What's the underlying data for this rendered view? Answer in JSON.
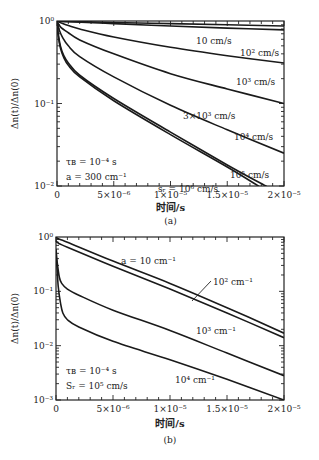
{
  "chart_data": [
    {
      "type": "line",
      "panel": "a",
      "caption": "(a)",
      "xlabel": "时间/s",
      "ylabel": "Δn(t)/Δn(0)",
      "xscale": "linear",
      "yscale": "log",
      "xlim": [
        0,
        2e-05
      ],
      "ylim": [
        0.01,
        1
      ],
      "xticks": [
        0,
        5e-06,
        1e-05,
        1.5e-05,
        2e-05
      ],
      "xtick_labels": [
        "0",
        "5×10⁻⁶",
        "1×10⁻⁵",
        "1.5×10⁻⁵",
        "2×10⁻⁵"
      ],
      "yticks": [
        1,
        0.1,
        0.01
      ],
      "ytick_labels": [
        "10⁰",
        "10⁻¹",
        "10⁻²"
      ],
      "grid": false,
      "annotations": [
        "τB = 10⁻⁴ s",
        "a = 300 cm⁻¹"
      ],
      "series": [
        {
          "name": "10 cm/s",
          "label": "10 cm/s",
          "x": [
            0,
            1e-06,
            5e-06,
            1e-05,
            1.5e-05,
            2e-05
          ],
          "y": [
            1.0,
            0.99,
            0.96,
            0.93,
            0.9,
            0.87
          ]
        },
        {
          "name": "10² cm/s",
          "label": "10² cm/s",
          "x": [
            0,
            1e-06,
            5e-06,
            1e-05,
            1.5e-05,
            2e-05
          ],
          "y": [
            1.0,
            0.98,
            0.93,
            0.87,
            0.82,
            0.78
          ]
        },
        {
          "name": "10³ cm/s",
          "label": "10³ cm/s",
          "x": [
            0,
            5e-07,
            1e-06,
            2e-06,
            5e-06,
            1e-05,
            1.5e-05,
            2e-05
          ],
          "y": [
            1.0,
            0.93,
            0.88,
            0.8,
            0.64,
            0.48,
            0.38,
            0.31
          ]
        },
        {
          "name": "3×10³ cm/s",
          "label": "3×10³ cm/s",
          "x": [
            0,
            3e-07,
            1e-06,
            2e-06,
            5e-06,
            1e-05,
            1.5e-05,
            2e-05
          ],
          "y": [
            1.0,
            0.85,
            0.72,
            0.59,
            0.4,
            0.23,
            0.15,
            0.1
          ]
        },
        {
          "name": "10⁴ cm/s",
          "label": "10⁴ cm/s",
          "x": [
            0,
            2e-07,
            5e-07,
            1e-06,
            2e-06,
            5e-06,
            1e-05,
            1.5e-05,
            2e-05
          ],
          "y": [
            1.0,
            0.78,
            0.63,
            0.5,
            0.37,
            0.21,
            0.095,
            0.048,
            0.025
          ]
        },
        {
          "name": "10⁵ cm/s",
          "label": "10⁵ cm/s",
          "x": [
            0,
            1e-07,
            3e-07,
            6e-07,
            1e-06,
            2e-06,
            5e-06,
            1e-05,
            1.5e-05,
            1.85e-05
          ],
          "y": [
            1.0,
            0.72,
            0.5,
            0.38,
            0.31,
            0.22,
            0.115,
            0.045,
            0.018,
            0.0098
          ]
        },
        {
          "name": "10⁶ cm/s",
          "label": "s_r = 10⁶ cm/s",
          "x": [
            0,
            1e-07,
            3e-07,
            6e-07,
            1e-06,
            2e-06,
            5e-06,
            1e-05,
            1.5e-05,
            1.78e-05
          ],
          "y": [
            1.0,
            0.68,
            0.47,
            0.36,
            0.29,
            0.21,
            0.108,
            0.042,
            0.017,
            0.0099
          ]
        }
      ]
    },
    {
      "type": "line",
      "panel": "b",
      "caption": "(b)",
      "xlabel": "时间/s",
      "ylabel": "Δn(t)/Δn(0)",
      "xscale": "linear",
      "yscale": "log",
      "xlim": [
        0,
        2e-05
      ],
      "ylim": [
        0.001,
        1
      ],
      "xticks": [
        0,
        5e-06,
        1e-05,
        1.5e-05,
        2e-05
      ],
      "xtick_labels": [
        "0",
        "5×10⁻⁶",
        "1×10⁻⁵",
        "1.5×10⁻⁵",
        "2×10⁻⁵"
      ],
      "yticks": [
        1,
        0.1,
        0.01,
        0.001
      ],
      "ytick_labels": [
        "10⁰",
        "10⁻¹",
        "10⁻²",
        "10⁻³"
      ],
      "grid": false,
      "annotations": [
        "τB = 10⁻⁴ s",
        "Sr = 10⁵ cm/s"
      ],
      "series": [
        {
          "name": "a = 10 cm⁻¹",
          "label": "a = 10 cm⁻¹",
          "x": [
            0,
            2e-07,
            1e-06,
            5e-06,
            1e-05,
            1.5e-05,
            2e-05
          ],
          "y": [
            1.0,
            0.93,
            0.8,
            0.36,
            0.14,
            0.05,
            0.017
          ]
        },
        {
          "name": "10² cm⁻¹",
          "label": "10² cm⁻¹",
          "x": [
            0,
            2e-07,
            1e-06,
            5e-06,
            1e-05,
            1.5e-05,
            2e-05
          ],
          "y": [
            0.85,
            0.77,
            0.65,
            0.29,
            0.11,
            0.04,
            0.014
          ]
        },
        {
          "name": "10³ cm⁻¹",
          "label": "10³ cm⁻¹",
          "x": [
            0,
            1e-07,
            3e-07,
            5e-07,
            1e-06,
            2e-06,
            5e-06,
            1e-05,
            1.5e-05,
            2e-05
          ],
          "y": [
            0.6,
            0.35,
            0.18,
            0.14,
            0.11,
            0.085,
            0.045,
            0.019,
            0.0073,
            0.0028
          ]
        },
        {
          "name": "10⁴ cm⁻¹",
          "label": "10⁴ cm⁻¹",
          "x": [
            0,
            1e-07,
            2e-07,
            4e-07,
            6e-07,
            1e-06,
            2e-06,
            5e-06,
            1e-05,
            1.5e-05,
            2e-05
          ],
          "y": [
            0.5,
            0.25,
            0.12,
            0.06,
            0.04,
            0.03,
            0.022,
            0.012,
            0.0055,
            0.0024,
            0.001
          ]
        }
      ]
    }
  ]
}
